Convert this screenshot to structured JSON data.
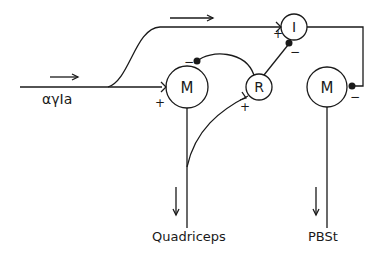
{
  "diagram": {
    "nodes": {
      "m1": {
        "label": "M"
      },
      "m2": {
        "label": "M"
      },
      "r": {
        "label": "R"
      },
      "i": {
        "label": "I"
      }
    },
    "labels": {
      "input": "αγIa",
      "out1": "Quadriceps",
      "out2": "PBSt"
    },
    "signs": {
      "m1_in": "+",
      "m1_inhib": "−",
      "r_in": "+",
      "i_in": "+",
      "i_inhib": "−",
      "m2_inhib": "−"
    },
    "colors": {
      "ink": "#1a1a1a",
      "background": "#ffffff"
    }
  }
}
